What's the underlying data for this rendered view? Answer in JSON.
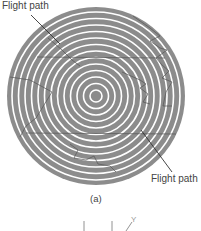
{
  "figure": {
    "caption": "(a)",
    "labels": {
      "flight_path_top": "Flight path",
      "flight_path_bottom": "Flight path",
      "axis_y": "Y"
    },
    "disk": {
      "center": [
        96,
        96
      ],
      "radius": 89,
      "track_count": 14,
      "fill_color": "#8c8c8c",
      "track_color": "#ffffff"
    },
    "colors": {
      "background": "#ffffff",
      "disk_fill": "#8c8c8c",
      "groove": "#ffffff",
      "trace": "#555555",
      "text": "#444444"
    }
  }
}
